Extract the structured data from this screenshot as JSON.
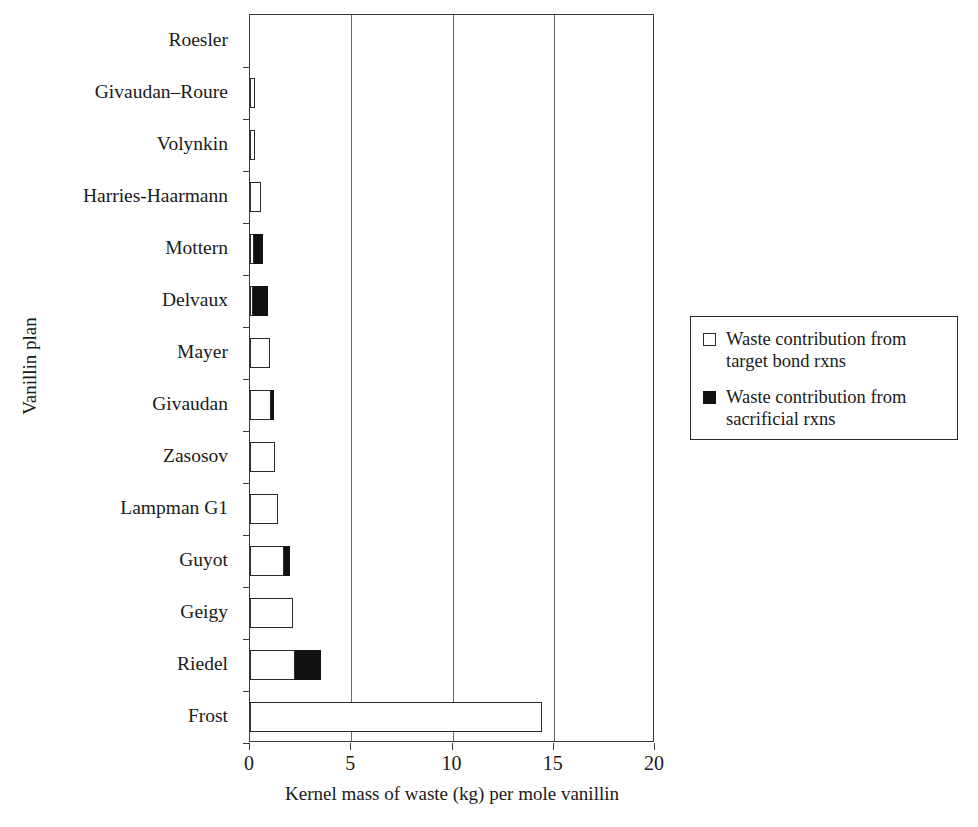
{
  "chart_data": {
    "type": "bar",
    "orientation": "horizontal",
    "stacked": true,
    "title": "",
    "xlabel": "Kernel mass of waste (kg) per mole vanillin",
    "ylabel": "Vanillin plan",
    "xlim": [
      0,
      20
    ],
    "xticks": [
      0,
      5,
      10,
      15,
      20
    ],
    "xtick_labels": [
      "0",
      "5",
      "10",
      "15",
      "20"
    ],
    "gridlines_x": [
      5,
      10,
      15
    ],
    "grid": true,
    "legend_position": "right",
    "categories": [
      "Roesler",
      "Givaudan–Roure",
      "Volynkin",
      "Harries-Haarmann",
      "Mottern",
      "Delvaux",
      "Mayer",
      "Givaudan",
      "Zasosov",
      "Lampman G1",
      "Guyot",
      "Geigy",
      "Riedel",
      "Frost"
    ],
    "series": [
      {
        "name": "Waste contribution from target bond rxns",
        "color": "#ffffff",
        "edge_color": "#2b2b2b",
        "values": [
          0.0,
          0.25,
          0.25,
          0.55,
          0.2,
          0.15,
          1.0,
          1.05,
          1.25,
          1.4,
          1.7,
          2.1,
          2.2,
          14.4
        ]
      },
      {
        "name": "Waste contribution from sacrificial rxns",
        "color": "#111111",
        "edge_color": "#111111",
        "values": [
          0.0,
          0.0,
          0.0,
          0.0,
          0.42,
          0.75,
          0.0,
          0.15,
          0.0,
          0.0,
          0.3,
          0.0,
          1.3,
          0.0
        ]
      }
    ],
    "totals": [
      0.0,
      0.25,
      0.25,
      0.55,
      0.62,
      0.9,
      1.0,
      1.2,
      1.25,
      1.4,
      2.0,
      2.1,
      3.5,
      14.4
    ]
  },
  "legend": {
    "items": [
      {
        "swatch": "open-square",
        "label": "Waste contribution from target bond rxns"
      },
      {
        "swatch": "filled-square",
        "label": "Waste contribution from sacrificial rxns"
      }
    ]
  },
  "colors": {
    "target_fill": "#ffffff",
    "sacrificial_fill": "#111111",
    "axis": "#3a3a3a",
    "grid": "#6a6a6a",
    "text": "#1a1a1a",
    "background": "#ffffff"
  }
}
